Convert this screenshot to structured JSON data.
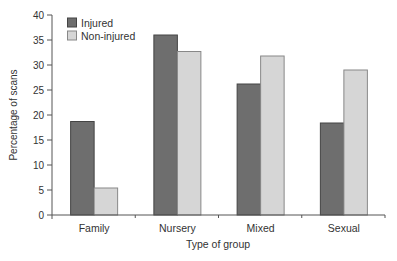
{
  "chart_data": {
    "type": "bar",
    "title": "",
    "xlabel": "Type of group",
    "ylabel": "Percentage of scans",
    "categories": [
      "Family",
      "Nursery",
      "Mixed",
      "Sexual"
    ],
    "series": [
      {
        "name": "Injured",
        "color": "#6e6e6e",
        "values": [
          18.7,
          36.0,
          26.2,
          18.4
        ]
      },
      {
        "name": "Non-injured",
        "color": "#d6d6d6",
        "values": [
          5.4,
          32.7,
          31.8,
          29.0
        ]
      }
    ],
    "ylim": [
      0,
      40
    ],
    "yticks": [
      0,
      5,
      10,
      15,
      20,
      25,
      30,
      35,
      40
    ],
    "grid": false,
    "legend_position": "top-left"
  }
}
